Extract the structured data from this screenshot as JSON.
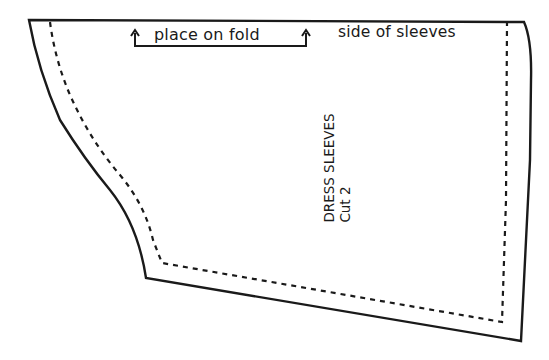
{
  "pattern": {
    "piece_name": "DRESS SLEEVES",
    "cut_instruction": "Cut 2",
    "fold_label": "place on fold",
    "side_label": "side of sleeves",
    "colors": {
      "line": "#1a1a1a",
      "background": "#ffffff"
    },
    "lines": {
      "cut_line": "solid",
      "seam_line": "dashed"
    }
  }
}
